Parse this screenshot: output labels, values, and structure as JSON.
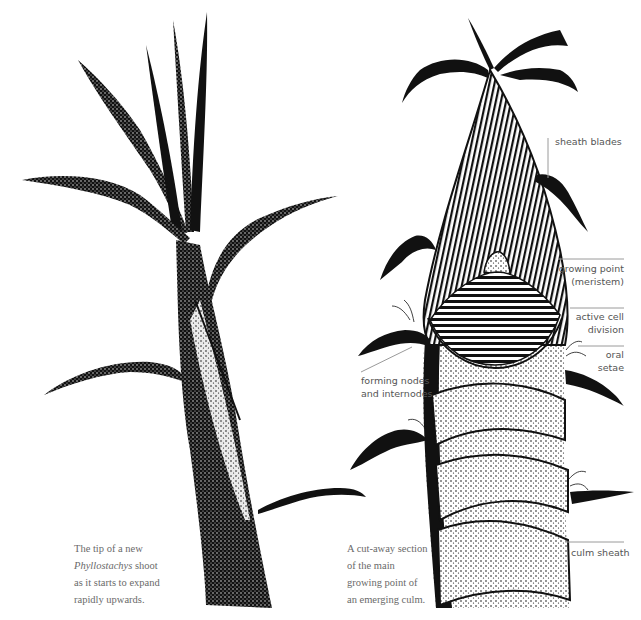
{
  "figure": {
    "left_drawing": {
      "subject": "Phyllostachys bamboo shoot tip",
      "caption": {
        "line1": "The tip of a new",
        "line2_italic": "Phyllostachys",
        "line2_rest": " shoot",
        "line3": "as it starts to expand",
        "line4": "rapidly upwards."
      }
    },
    "right_drawing": {
      "subject": "Cut-away section of emerging culm",
      "caption": {
        "line1": "A cut-away section",
        "line2": "of the main",
        "line3": "growing point of",
        "line4": "an emerging culm."
      },
      "labels": {
        "sheath_blades": "sheath blades",
        "growing_point_1": "growing point",
        "growing_point_2": "(meristem)",
        "active_cell_1": "active cell",
        "active_cell_2": "division",
        "oral_setae_1": "oral",
        "oral_setae_2": "setae",
        "forming_nodes_1": "forming nodes",
        "forming_nodes_2": "and internodes",
        "culm_sheath": "culm sheath"
      }
    }
  },
  "colors": {
    "ink": "#0d0d0d",
    "label_text": "#555555",
    "caption_text": "#6a6a6a",
    "leader_line": "#9a9a9a",
    "background": "#ffffff"
  }
}
